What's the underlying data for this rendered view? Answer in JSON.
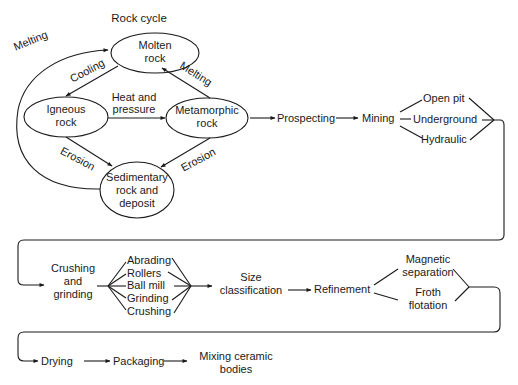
{
  "title": "Rock cycle",
  "rock_cycle": {
    "nodes": {
      "molten": [
        "Molten",
        "rock"
      ],
      "igneous": [
        "Igneous",
        "rock"
      ],
      "metamorphic": [
        "Metamorphic",
        "rock"
      ],
      "sedimentary": [
        "Sedimentary",
        "rock and",
        "deposit"
      ]
    },
    "edges": {
      "melting_left": "Melting",
      "cooling": "Cooling",
      "melting_right": "Melting",
      "heat_pressure": [
        "Heat and",
        "pressure"
      ],
      "erosion_left": "Erosion",
      "erosion_right": "Erosion"
    }
  },
  "row1": {
    "prospecting": "Prospecting",
    "mining": "Mining",
    "mining_methods": [
      "Open pit",
      "Underground",
      "Hydraulic"
    ]
  },
  "row2": {
    "crushing_grinding": [
      "Crushing",
      "and",
      "grinding"
    ],
    "methods": [
      "Abrading",
      "Rollers",
      "Ball mill",
      "Grinding",
      "Crushing"
    ],
    "size_classification": [
      "Size",
      "classification"
    ],
    "refinement": "Refinement",
    "refinement_methods": {
      "magnetic": [
        "Magnetic",
        "separation"
      ],
      "froth": [
        "Froth",
        "flotation"
      ]
    }
  },
  "row3": {
    "drying": "Drying",
    "packaging": "Packaging",
    "mixing": [
      "Mixing ceramic",
      "bodies"
    ]
  }
}
